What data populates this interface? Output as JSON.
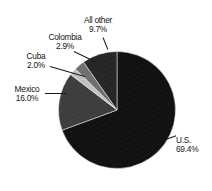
{
  "title": {
    "text": "",
    "note": "clipped"
  },
  "chart_data": {
    "type": "pie",
    "title": "",
    "xlabel": "",
    "ylabel": "",
    "unit": "percent",
    "start_angle_deg": 0,
    "direction": "clockwise",
    "legend": "none",
    "labels_position": "outside-with-leader-lines",
    "categories": [
      "U.S.",
      "Mexico",
      "Cuba",
      "Colombia",
      "All other"
    ],
    "values": [
      69.4,
      16.0,
      2.0,
      2.9,
      9.7
    ],
    "slices": [
      {
        "name": "U.S.",
        "value": 69.4,
        "value_label": "69.4%",
        "color": "#0d0d0d"
      },
      {
        "name": "Mexico",
        "value": 16.0,
        "value_label": "16.0%",
        "color": "#3b3b3b"
      },
      {
        "name": "Cuba",
        "value": 2.0,
        "value_label": "2.0%",
        "color": "#c2c2c2"
      },
      {
        "name": "Colombia",
        "value": 2.9,
        "value_label": "2.9%",
        "color": "#6e6e6e"
      },
      {
        "name": "All other",
        "value": 9.7,
        "value_label": "9.7%",
        "color": "#232323"
      }
    ]
  },
  "labels": {
    "us": {
      "name": "U.S.",
      "percent": "69.4%"
    },
    "mexico": {
      "name": "Mexico",
      "percent": "16.0%"
    },
    "cuba": {
      "name": "Cuba",
      "percent": "2.0%"
    },
    "colombia": {
      "name": "Colombia",
      "percent": "2.9%"
    },
    "allother": {
      "name": "All other",
      "percent": "9.7%"
    }
  },
  "colors": {
    "background": "#ffffff",
    "text": "#141414",
    "leader_line": "#1a1a1a"
  }
}
